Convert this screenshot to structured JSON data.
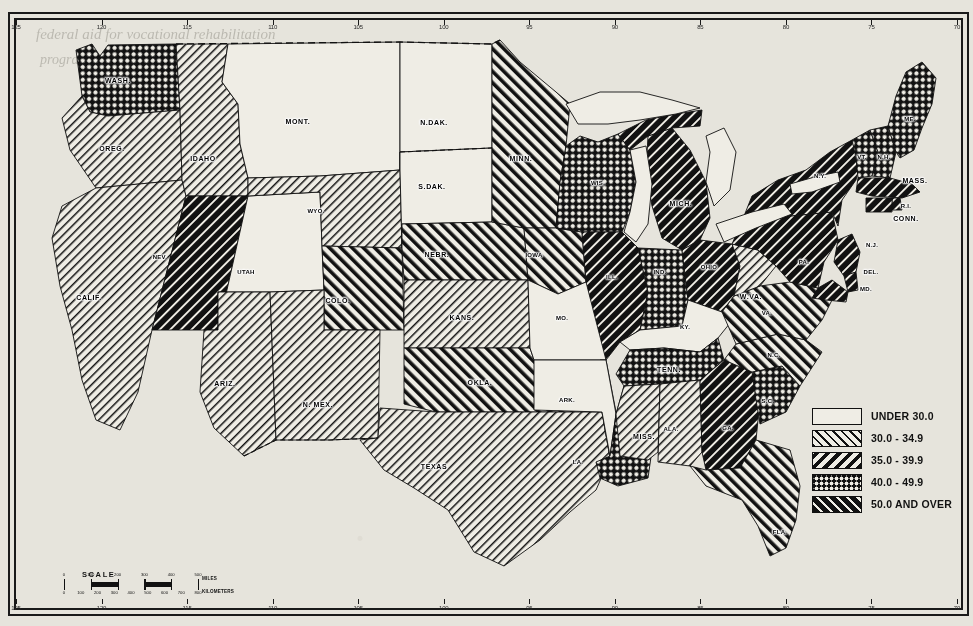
{
  "map": {
    "projection_note": "contiguous United States",
    "background_color": "#e6e4dc",
    "ink_color": "#111111"
  },
  "legend": {
    "title": "",
    "classes": [
      {
        "label": "UNDER 30.0",
        "pattern": "solid-white",
        "css": "p0"
      },
      {
        "label": "30.0 - 34.9",
        "pattern": "thin-hatch-right",
        "css": "p1"
      },
      {
        "label": "35.0 - 39.9",
        "pattern": "bold-hatch-left",
        "css": "p2"
      },
      {
        "label": "40.0 - 49.9",
        "pattern": "cross-hatch",
        "css": "p3"
      },
      {
        "label": "50.0 AND OVER",
        "pattern": "solid-black-hatch",
        "css": "p4"
      }
    ]
  },
  "scale": {
    "title": "SCALE",
    "unit_top": "MILES",
    "unit_bottom": "KILOMETERS",
    "miles_ticks": [
      "0",
      "100",
      "200",
      "300",
      "400",
      "500"
    ],
    "km_ticks": [
      "0",
      "100",
      "200",
      "300",
      "400",
      "500",
      "600",
      "700",
      "800"
    ]
  },
  "graticule": {
    "top_labels": [
      "125",
      "120",
      "115",
      "110",
      "105",
      "100",
      "95",
      "90",
      "85",
      "80",
      "75",
      "70"
    ],
    "bottom_labels": [
      "125",
      "120",
      "115",
      "110",
      "105",
      "100",
      "95",
      "90",
      "85",
      "80",
      "75",
      "70"
    ]
  },
  "bleed_text": {
    "line1": "federal aid for vocational rehabilitation",
    "line2": "programs in the several States"
  },
  "chart_data": {
    "type": "map",
    "title": "",
    "value_classes": [
      "UNDER 30.0",
      "30.0 - 34.9",
      "35.0 - 39.9",
      "40.0 - 49.9",
      "50.0 AND OVER"
    ],
    "states": [
      {
        "abbr": "WASH.",
        "label": "WASH.",
        "class": 3,
        "x": 118,
        "y": 80
      },
      {
        "abbr": "OREG.",
        "label": "OREG.",
        "class": 1,
        "x": 112,
        "y": 148
      },
      {
        "abbr": "CALIF.",
        "label": "CALIF.",
        "class": 1,
        "x": 89,
        "y": 297
      },
      {
        "abbr": "IDAHO",
        "label": "IDAHO",
        "class": 1,
        "x": 203,
        "y": 158
      },
      {
        "abbr": "NEV.",
        "label": "NEV.",
        "class": 4,
        "x": 160,
        "y": 257
      },
      {
        "abbr": "MONT.",
        "label": "MONT.",
        "class": 0,
        "x": 298,
        "y": 121
      },
      {
        "abbr": "WYO.",
        "label": "WYO.",
        "class": 1,
        "x": 316,
        "y": 211
      },
      {
        "abbr": "UTAH",
        "label": "UTAH",
        "class": 0,
        "x": 246,
        "y": 272
      },
      {
        "abbr": "ARIZ.",
        "label": "ARIZ.",
        "class": 1,
        "x": 225,
        "y": 383
      },
      {
        "abbr": "N.MEX.",
        "label": "N. MEX.",
        "class": 1,
        "x": 318,
        "y": 404
      },
      {
        "abbr": "COLO.",
        "label": "COLO.",
        "class": 2,
        "x": 338,
        "y": 300
      },
      {
        "abbr": "N.DAK.",
        "label": "N.DAK.",
        "class": 0,
        "x": 434,
        "y": 122
      },
      {
        "abbr": "S.DAK.",
        "label": "S.DAK.",
        "class": 0,
        "x": 432,
        "y": 186
      },
      {
        "abbr": "NEBR.",
        "label": "NEBR.",
        "class": 2,
        "x": 437,
        "y": 254
      },
      {
        "abbr": "KANS.",
        "label": "KANS.",
        "class": 1,
        "x": 462,
        "y": 317
      },
      {
        "abbr": "OKLA.",
        "label": "OKLA.",
        "class": 2,
        "x": 480,
        "y": 382
      },
      {
        "abbr": "TEXAS",
        "label": "TEXAS",
        "class": 1,
        "x": 434,
        "y": 466
      },
      {
        "abbr": "MINN.",
        "label": "MINN.",
        "class": 2,
        "x": 521,
        "y": 158
      },
      {
        "abbr": "IOWA",
        "label": "IOWA",
        "class": 2,
        "x": 534,
        "y": 255
      },
      {
        "abbr": "MO.",
        "label": "MO.",
        "class": 0,
        "x": 562,
        "y": 318
      },
      {
        "abbr": "ARK.",
        "label": "ARK.",
        "class": 0,
        "x": 567,
        "y": 400
      },
      {
        "abbr": "LA.",
        "label": "LA.",
        "class": 3,
        "x": 578,
        "y": 462
      },
      {
        "abbr": "WIS.",
        "label": "WIS.",
        "class": 3,
        "x": 598,
        "y": 183
      },
      {
        "abbr": "ILL.",
        "label": "ILL.",
        "class": 4,
        "x": 612,
        "y": 277
      },
      {
        "abbr": "MICH.",
        "label": "MICH.",
        "class": 4,
        "x": 681,
        "y": 203
      },
      {
        "abbr": "IND.",
        "label": "IND.",
        "class": 3,
        "x": 660,
        "y": 272
      },
      {
        "abbr": "OHIO",
        "label": "OHIO",
        "class": 4,
        "x": 709,
        "y": 267
      },
      {
        "abbr": "KY.",
        "label": "KY.",
        "class": 0,
        "x": 685,
        "y": 327
      },
      {
        "abbr": "TENN.",
        "label": "TENN.",
        "class": 3,
        "x": 669,
        "y": 369
      },
      {
        "abbr": "MISS.",
        "label": "MISS.",
        "class": 1,
        "x": 644,
        "y": 436
      },
      {
        "abbr": "ALA.",
        "label": "ALA.",
        "class": 1,
        "x": 671,
        "y": 429
      },
      {
        "abbr": "GA.",
        "label": "GA.",
        "class": 4,
        "x": 728,
        "y": 428
      },
      {
        "abbr": "FLA.",
        "label": "FLA.",
        "class": 2,
        "x": 780,
        "y": 532
      },
      {
        "abbr": "S.C.",
        "label": "S.C.",
        "class": 3,
        "x": 768,
        "y": 401
      },
      {
        "abbr": "N.C.",
        "label": "N.C.",
        "class": 2,
        "x": 774,
        "y": 355
      },
      {
        "abbr": "VA.",
        "label": "VA.",
        "class": 2,
        "x": 767,
        "y": 313
      },
      {
        "abbr": "W.VA.",
        "label": "W.VA.",
        "class": 1,
        "x": 751,
        "y": 296
      },
      {
        "abbr": "PA.",
        "label": "PA.",
        "class": 4,
        "x": 804,
        "y": 262
      },
      {
        "abbr": "N.Y.",
        "label": "N.Y.",
        "class": 4,
        "x": 820,
        "y": 176
      },
      {
        "abbr": "VT.",
        "label": "VT.",
        "class": 3,
        "x": 862,
        "y": 157
      },
      {
        "abbr": "N.H.",
        "label": "N.H.",
        "class": 3,
        "x": 884,
        "y": 157
      },
      {
        "abbr": "ME.",
        "label": "ME.",
        "class": 3,
        "x": 910,
        "y": 119
      },
      {
        "abbr": "MASS.",
        "label": "MASS.",
        "class": 4,
        "x": 915,
        "y": 180
      },
      {
        "abbr": "R.I.",
        "label": "R.I.",
        "class": 4,
        "x": 906,
        "y": 206
      },
      {
        "abbr": "CONN.",
        "label": "CONN.",
        "class": 4,
        "x": 906,
        "y": 218
      },
      {
        "abbr": "N.J.",
        "label": "N.J.",
        "class": 4,
        "x": 872,
        "y": 245
      },
      {
        "abbr": "DEL.",
        "label": "DEL.",
        "class": 4,
        "x": 871,
        "y": 272
      },
      {
        "abbr": "MD.",
        "label": "MD.",
        "class": 4,
        "x": 866,
        "y": 289
      }
    ]
  }
}
